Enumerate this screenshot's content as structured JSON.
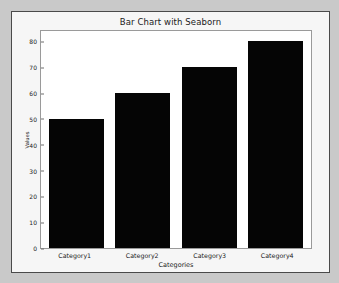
{
  "chart_data": {
    "type": "bar",
    "title": "Bar Chart with Seaborn",
    "xlabel": "Categories",
    "ylabel": "Values",
    "categories": [
      "Category1",
      "Category2",
      "Category3",
      "Category4"
    ],
    "values": [
      50,
      60,
      70,
      80
    ],
    "yticks": [
      0,
      10,
      20,
      30,
      40,
      50,
      60,
      70,
      80
    ],
    "ylim": [
      0,
      84
    ],
    "grid": false,
    "legend": null,
    "bar_color": "#050505",
    "plot_background": "#ffffff",
    "figure_background": "#f6f6f6",
    "page_background": "#c9c9c9",
    "axis_color": "#9a9a9a",
    "text_color": "#1a1a1a"
  }
}
